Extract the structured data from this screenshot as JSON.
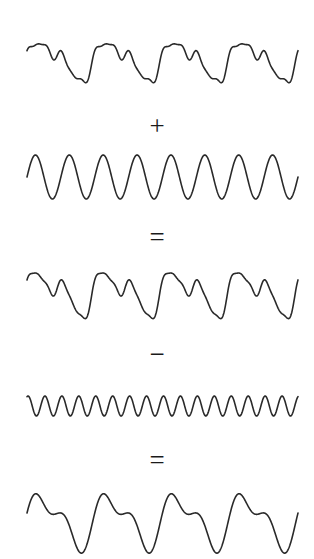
{
  "figure": {
    "background_color": "#ffffff",
    "stroke_color": "#2a2a2a",
    "stroke_width": 1.6,
    "width": 314,
    "height": 559
  },
  "operators": {
    "plus": "+",
    "equals_first": "=",
    "minus": "−",
    "equals_second": "="
  },
  "chart_data": {
    "type": "line",
    "xlabel": "",
    "ylabel": "",
    "grid": false,
    "legend": "none",
    "x_range": [
      0,
      1
    ],
    "plot_left_px": 27,
    "plot_right_px": 298,
    "panels": [
      {
        "id": "wave-1",
        "name": "complex-input-wave",
        "role": "operand-a",
        "operator_below": "+",
        "baseline_y": 60,
        "amplitude_px": 30,
        "y_top": 30,
        "y_bottom": 91,
        "components": [
          {
            "cycles": 4,
            "amplitude": 1.0,
            "phase": 0.0
          },
          {
            "cycles": 8,
            "amplitude": 0.42,
            "phase": 0.6
          },
          {
            "cycles": 16,
            "amplitude": 0.24,
            "phase": 1.2
          },
          {
            "cycles": 24,
            "amplitude": 0.1,
            "phase": 2.1
          }
        ]
      },
      {
        "id": "wave-2",
        "name": "added-sine-wave",
        "role": "operand-b",
        "operator_below": "=",
        "baseline_y": 177,
        "amplitude_px": 22,
        "y_top": 155,
        "y_bottom": 199,
        "components": [
          {
            "cycles": 8,
            "amplitude": 1.0,
            "phase": 0.0
          }
        ]
      },
      {
        "id": "wave-3",
        "name": "sum-wave",
        "role": "result-sum",
        "operator_below": "−",
        "baseline_y": 292,
        "amplitude_px": 34,
        "y_top": 258,
        "y_bottom": 327,
        "components": [
          {
            "cycles": 4,
            "amplitude": 1.0,
            "phase": 0.0
          },
          {
            "cycles": 8,
            "amplitude": 0.8,
            "phase": 0.6
          },
          {
            "cycles": 16,
            "amplitude": 0.24,
            "phase": 1.2
          },
          {
            "cycles": 24,
            "amplitude": 0.1,
            "phase": 2.1
          }
        ]
      },
      {
        "id": "wave-4",
        "name": "subtracted-high-frequency-wave",
        "role": "operand-c",
        "operator_below": "=",
        "baseline_y": 406,
        "amplitude_px": 10,
        "y_top": 396,
        "y_bottom": 416,
        "components": [
          {
            "cycles": 16,
            "amplitude": 1.0,
            "phase": 1.2
          }
        ]
      },
      {
        "id": "wave-5",
        "name": "final-smoothed-wave",
        "role": "result-difference",
        "operator_below": "",
        "baseline_y": 520,
        "amplitude_px": 35,
        "y_top": 485,
        "y_bottom": 559,
        "components": [
          {
            "cycles": 4,
            "amplitude": 1.0,
            "phase": 0.0
          },
          {
            "cycles": 8,
            "amplitude": 0.55,
            "phase": 0.6
          }
        ]
      }
    ]
  }
}
